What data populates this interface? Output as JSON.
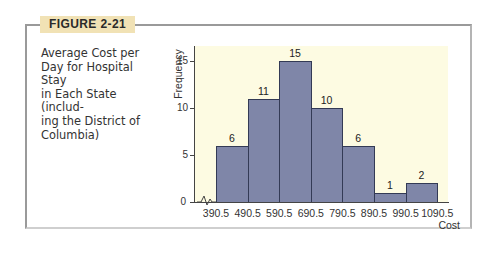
{
  "figure": {
    "label": "FIGURE 2-21",
    "caption": "Average Cost per Day for Hospital Stay in Each State (including the District of Columbia)",
    "caption_lines": [
      "Average Cost per",
      "Day for Hospital Stay",
      "in Each State (includ-",
      "ing the District of",
      "Columbia)"
    ]
  },
  "colors": {
    "label_bg": "#f1e2b5",
    "plot_bg": "#fdfbe2",
    "bar_fill": "#7f86a8",
    "bar_edge": "#333a55"
  },
  "chart_data": {
    "type": "bar",
    "subtype": "histogram",
    "xlabel": "Cost",
    "ylabel": "Frequency",
    "bin_edges": [
      390.5,
      490.5,
      590.5,
      690.5,
      790.5,
      890.5,
      990.5,
      1090.5
    ],
    "categories": [
      "390.5-490.5",
      "490.5-590.5",
      "590.5-690.5",
      "690.5-790.5",
      "790.5-890.5",
      "890.5-990.5",
      "990.5-1090.5"
    ],
    "values": [
      6,
      11,
      15,
      10,
      6,
      1,
      2
    ],
    "data_labels": [
      "6",
      "11",
      "15",
      "10",
      "6",
      "1",
      "2"
    ],
    "x_tick_labels": [
      "390.5",
      "490.5",
      "590.5",
      "690.5",
      "790.5",
      "890.5",
      "990.5",
      "1090.5"
    ],
    "y_ticks": [
      0,
      5,
      10,
      15
    ],
    "y_tick_labels": [
      "0",
      "5",
      "10",
      "15"
    ],
    "ylim": [
      0,
      16.5
    ],
    "x_axis_break": true,
    "grid": false,
    "legend": null
  }
}
